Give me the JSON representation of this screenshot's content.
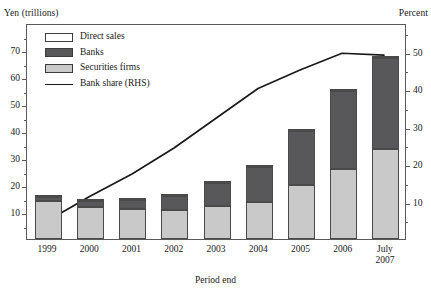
{
  "chart_data": {
    "type": "bar",
    "title": "",
    "subtitle": "",
    "xlabel": "Period end",
    "ylabel": "Yen (trillions)",
    "ylabel_right": "Percent",
    "categories": [
      "1999",
      "2000",
      "2001",
      "2002",
      "2003",
      "2004",
      "2005",
      "2006",
      "July\n2007"
    ],
    "stacked": true,
    "ylim": [
      0,
      80
    ],
    "yticks": [
      10,
      20,
      30,
      40,
      50,
      60,
      70
    ],
    "yticks_minor": [
      5,
      15,
      25,
      35,
      45,
      55,
      65,
      75
    ],
    "ylim_right": [
      0,
      57.6
    ],
    "yticks_right": [
      10,
      20,
      30,
      40,
      50
    ],
    "yticks_right_minor": [
      5,
      15,
      25,
      35,
      45,
      55
    ],
    "grid": false,
    "legend_position": "top-left",
    "series": [
      {
        "name": "Securities firms",
        "axis": "left",
        "color": "#c9c9c9",
        "values": [
          14.0,
          11.8,
          11.0,
          10.6,
          12.3,
          13.7,
          20.0,
          26.0,
          33.5
        ]
      },
      {
        "name": "Banks",
        "axis": "left",
        "color": "#58585a",
        "values": [
          1.4,
          2.4,
          3.6,
          5.2,
          8.5,
          13.1,
          20.0,
          29.0,
          33.5
        ]
      },
      {
        "name": "Direct sales",
        "axis": "left",
        "color": "#ffffff",
        "values": [
          0.2,
          0.2,
          0.2,
          0.2,
          0.2,
          0.2,
          0.2,
          0.2,
          0.2
        ]
      },
      {
        "name": "Bank share (RHS)",
        "type": "line",
        "axis": "right",
        "color": "#1a1a1a",
        "values": [
          5.0,
          11.5,
          17.5,
          24.5,
          32.5,
          40.5,
          45.5,
          50.0,
          51.0
        ]
      }
    ],
    "totals": [
      15.6,
      14.4,
      14.8,
      16.0,
      21.0,
      27.0,
      40.2,
      55.2,
      67.2
    ],
    "line_points_right_axis": [
      {
        "x": "1999",
        "y": 5.0
      },
      {
        "x": "2000",
        "y": 11.5
      },
      {
        "x": "2001",
        "y": 17.5
      },
      {
        "x": "2002",
        "y": 24.5
      },
      {
        "x": "2003",
        "y": 32.5
      },
      {
        "x": "2004",
        "y": 40.5
      },
      {
        "x": "2005",
        "y": 45.5
      },
      {
        "x": "2006",
        "y": 50.0
      },
      {
        "x": "July 2007",
        "y": 49.5
      }
    ],
    "line_peak_right_axis": 51.0,
    "legend": [
      {
        "label": "Direct sales",
        "mark": "swatch",
        "color": "#ffffff"
      },
      {
        "label": "Banks",
        "mark": "swatch",
        "color": "#58585a"
      },
      {
        "label": "Securities firms",
        "mark": "swatch",
        "color": "#c9c9c9"
      },
      {
        "label": "Bank share (RHS)",
        "mark": "line",
        "color": "#1a1a1a"
      }
    ]
  }
}
